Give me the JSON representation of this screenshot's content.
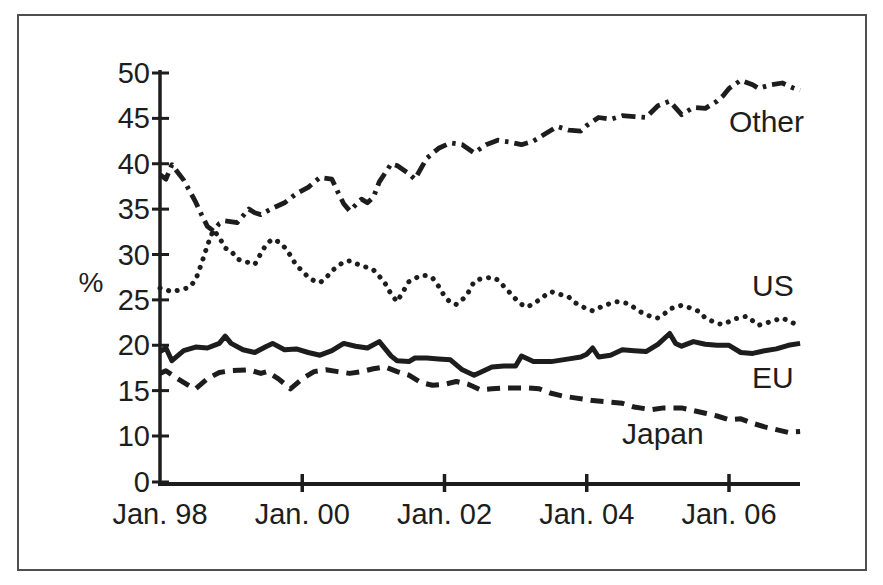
{
  "figure": {
    "background": "#ffffff",
    "border_color": "#4f4f4f",
    "ink_color": "#1d1d1d"
  },
  "chart_data": {
    "type": "line",
    "title": "",
    "ylabel": "%",
    "xlabel": "",
    "grid": false,
    "legend_position": "inline-labels",
    "x_axis": {
      "tick_labels": [
        "Jan. 98",
        "Jan. 00",
        "Jan. 02",
        "Jan. 04",
        "Jan. 06"
      ],
      "tick_months": [
        0,
        24,
        48,
        72,
        96
      ]
    },
    "y_axis": {
      "tick_labels": [
        "50",
        "45",
        "40",
        "35",
        "30",
        "25",
        "20",
        "15",
        "10",
        "0"
      ],
      "tick_values": [
        50,
        45,
        40,
        35,
        30,
        25,
        20,
        15,
        10,
        0
      ]
    },
    "series": [
      {
        "name": "Other",
        "label": "Other",
        "line_style": "dashdot",
        "label_xy": [
          729,
          132
        ],
        "points": [
          [
            0,
            38.8
          ],
          [
            1,
            38.3
          ],
          [
            2,
            39.9
          ],
          [
            4,
            38.2
          ],
          [
            6,
            35.8
          ],
          [
            7,
            34.4
          ],
          [
            8,
            33.1
          ],
          [
            9,
            32.6
          ],
          [
            10,
            33.4
          ],
          [
            11,
            33.7
          ],
          [
            13,
            33.5
          ],
          [
            15,
            35.0
          ],
          [
            16,
            34.6
          ],
          [
            17,
            34.4
          ],
          [
            19,
            35.1
          ],
          [
            21,
            35.7
          ],
          [
            23,
            36.7
          ],
          [
            25,
            37.4
          ],
          [
            27,
            38.5
          ],
          [
            29,
            38.3
          ],
          [
            30,
            36.9
          ],
          [
            31,
            35.6
          ],
          [
            32,
            34.8
          ],
          [
            34,
            36.1
          ],
          [
            35,
            35.7
          ],
          [
            36,
            36.3
          ],
          [
            37,
            38.0
          ],
          [
            39,
            40.0
          ],
          [
            40,
            39.8
          ],
          [
            42,
            38.9
          ],
          [
            43,
            38.3
          ],
          [
            45,
            40.6
          ],
          [
            47,
            41.7
          ],
          [
            49,
            42.3
          ],
          [
            51,
            42.1
          ],
          [
            53,
            41.2
          ],
          [
            55,
            42.1
          ],
          [
            57,
            42.6
          ],
          [
            59,
            42.4
          ],
          [
            61,
            42.1
          ],
          [
            63,
            42.5
          ],
          [
            65,
            43.3
          ],
          [
            67,
            44.1
          ],
          [
            69,
            43.7
          ],
          [
            71,
            43.6
          ],
          [
            72,
            44.2
          ],
          [
            74,
            45.1
          ],
          [
            76,
            44.9
          ],
          [
            78,
            45.3
          ],
          [
            80,
            45.2
          ],
          [
            82,
            45.1
          ],
          [
            84,
            46.4
          ],
          [
            86,
            46.9
          ],
          [
            88,
            45.4
          ],
          [
            90,
            46.2
          ],
          [
            92,
            46.1
          ],
          [
            94,
            46.9
          ],
          [
            95,
            47.5
          ],
          [
            96,
            48.3
          ],
          [
            98,
            49.2
          ],
          [
            100,
            48.7
          ],
          [
            101,
            48.3
          ],
          [
            103,
            48.7
          ],
          [
            105,
            48.9
          ],
          [
            107,
            48.3
          ],
          [
            108,
            48.1
          ]
        ]
      },
      {
        "name": "US",
        "label": "US",
        "line_style": "dotted",
        "label_xy": [
          752,
          296
        ],
        "points": [
          [
            0,
            26.3
          ],
          [
            2,
            25.9
          ],
          [
            4,
            26.2
          ],
          [
            5,
            26.4
          ],
          [
            6,
            27.2
          ],
          [
            7,
            29.0
          ],
          [
            8,
            31.0
          ],
          [
            9,
            32.7
          ],
          [
            10,
            31.9
          ],
          [
            11,
            30.7
          ],
          [
            12,
            30.4
          ],
          [
            13,
            29.5
          ],
          [
            14,
            29.3
          ],
          [
            15,
            29.1
          ],
          [
            16,
            28.9
          ],
          [
            17,
            30.1
          ],
          [
            18,
            31.2
          ],
          [
            19,
            31.7
          ],
          [
            20,
            31.4
          ],
          [
            21,
            30.8
          ],
          [
            22,
            29.9
          ],
          [
            23,
            28.8
          ],
          [
            24,
            28.2
          ],
          [
            25,
            27.5
          ],
          [
            26,
            27.1
          ],
          [
            27,
            26.9
          ],
          [
            28,
            27.4
          ],
          [
            29,
            28.2
          ],
          [
            30,
            28.7
          ],
          [
            31,
            29.2
          ],
          [
            32,
            29.3
          ],
          [
            33,
            29.0
          ],
          [
            34,
            28.8
          ],
          [
            36,
            28.3
          ],
          [
            37,
            27.6
          ],
          [
            38,
            26.8
          ],
          [
            39,
            25.6
          ],
          [
            40,
            24.8
          ],
          [
            41,
            25.9
          ],
          [
            42,
            27.0
          ],
          [
            44,
            27.7
          ],
          [
            45,
            27.7
          ],
          [
            46,
            27.4
          ],
          [
            47,
            26.5
          ],
          [
            48,
            25.4
          ],
          [
            49,
            24.7
          ],
          [
            50,
            24.5
          ],
          [
            51,
            25.0
          ],
          [
            52,
            25.8
          ],
          [
            53,
            27.0
          ],
          [
            54,
            27.3
          ],
          [
            56,
            27.5
          ],
          [
            57,
            27.2
          ],
          [
            58,
            26.5
          ],
          [
            59,
            25.8
          ],
          [
            60,
            25.1
          ],
          [
            61,
            24.5
          ],
          [
            62,
            24.2
          ],
          [
            63,
            24.6
          ],
          [
            64,
            25.0
          ],
          [
            65,
            25.5
          ],
          [
            66,
            25.9
          ],
          [
            67,
            25.7
          ],
          [
            68,
            25.5
          ],
          [
            69,
            25.3
          ],
          [
            70,
            24.7
          ],
          [
            72,
            24.0
          ],
          [
            73,
            23.8
          ],
          [
            75,
            24.4
          ],
          [
            77,
            24.8
          ],
          [
            79,
            24.6
          ],
          [
            81,
            23.7
          ],
          [
            83,
            23.1
          ],
          [
            84,
            23.0
          ],
          [
            85,
            23.4
          ],
          [
            86,
            24.0
          ],
          [
            88,
            24.4
          ],
          [
            90,
            24.0
          ],
          [
            91,
            23.7
          ],
          [
            92,
            23.0
          ],
          [
            94,
            22.4
          ],
          [
            95,
            22.3
          ],
          [
            97,
            22.9
          ],
          [
            99,
            23.2
          ],
          [
            101,
            22.2
          ],
          [
            103,
            22.6
          ],
          [
            105,
            23.0
          ],
          [
            107,
            22.4
          ],
          [
            108,
            21.9
          ]
        ]
      },
      {
        "name": "EU",
        "label": "EU",
        "line_style": "solid",
        "label_xy": [
          752,
          388
        ],
        "points": [
          [
            0,
            19.3
          ],
          [
            1,
            19.7
          ],
          [
            2,
            18.3
          ],
          [
            4,
            19.4
          ],
          [
            6,
            19.8
          ],
          [
            8,
            19.7
          ],
          [
            10,
            20.2
          ],
          [
            11,
            21.0
          ],
          [
            12,
            20.2
          ],
          [
            14,
            19.5
          ],
          [
            16,
            19.2
          ],
          [
            18,
            19.9
          ],
          [
            19,
            20.2
          ],
          [
            21,
            19.5
          ],
          [
            23,
            19.6
          ],
          [
            25,
            19.2
          ],
          [
            27,
            18.9
          ],
          [
            29,
            19.4
          ],
          [
            31,
            20.2
          ],
          [
            33,
            19.9
          ],
          [
            35,
            19.7
          ],
          [
            37,
            20.4
          ],
          [
            39,
            18.8
          ],
          [
            40,
            18.3
          ],
          [
            42,
            18.2
          ],
          [
            43,
            18.6
          ],
          [
            45,
            18.6
          ],
          [
            47,
            18.5
          ],
          [
            49,
            18.4
          ],
          [
            51,
            17.3
          ],
          [
            53,
            16.7
          ],
          [
            54,
            17.0
          ],
          [
            56,
            17.6
          ],
          [
            58,
            17.7
          ],
          [
            60,
            17.7
          ],
          [
            61,
            18.8
          ],
          [
            63,
            18.2
          ],
          [
            66,
            18.2
          ],
          [
            69,
            18.5
          ],
          [
            71,
            18.7
          ],
          [
            72,
            19.0
          ],
          [
            73,
            19.7
          ],
          [
            74,
            18.7
          ],
          [
            76,
            18.9
          ],
          [
            78,
            19.5
          ],
          [
            80,
            19.4
          ],
          [
            82,
            19.3
          ],
          [
            84,
            20.1
          ],
          [
            86,
            21.3
          ],
          [
            87,
            20.2
          ],
          [
            88,
            19.9
          ],
          [
            90,
            20.4
          ],
          [
            92,
            20.1
          ],
          [
            94,
            20.0
          ],
          [
            96,
            20.0
          ],
          [
            98,
            19.2
          ],
          [
            100,
            19.1
          ],
          [
            102,
            19.4
          ],
          [
            104,
            19.6
          ],
          [
            106,
            20.0
          ],
          [
            108,
            20.2
          ]
        ]
      },
      {
        "name": "Japan",
        "label": "Japan",
        "line_style": "dashed",
        "label_xy": [
          622,
          444
        ],
        "points": [
          [
            0,
            16.9
          ],
          [
            1,
            17.2
          ],
          [
            3,
            16.3
          ],
          [
            5,
            15.5
          ],
          [
            6,
            15.2
          ],
          [
            8,
            16.3
          ],
          [
            10,
            17.0
          ],
          [
            12,
            17.2
          ],
          [
            15,
            17.3
          ],
          [
            17,
            16.9
          ],
          [
            18,
            17.1
          ],
          [
            20,
            16.3
          ],
          [
            22,
            15.2
          ],
          [
            24,
            16.3
          ],
          [
            26,
            17.1
          ],
          [
            28,
            17.3
          ],
          [
            30,
            17.1
          ],
          [
            32,
            16.9
          ],
          [
            34,
            17.1
          ],
          [
            36,
            17.4
          ],
          [
            38,
            17.6
          ],
          [
            40,
            17.1
          ],
          [
            42,
            16.7
          ],
          [
            44,
            15.9
          ],
          [
            46,
            15.6
          ],
          [
            48,
            15.7
          ],
          [
            50,
            16.0
          ],
          [
            52,
            15.7
          ],
          [
            54,
            15.1
          ],
          [
            56,
            15.2
          ],
          [
            58,
            15.3
          ],
          [
            60,
            15.3
          ],
          [
            62,
            15.3
          ],
          [
            64,
            15.2
          ],
          [
            66,
            14.7
          ],
          [
            68,
            14.4
          ],
          [
            70,
            14.2
          ],
          [
            73,
            13.9
          ],
          [
            75,
            13.8
          ],
          [
            78,
            13.6
          ],
          [
            80,
            13.2
          ],
          [
            83,
            12.9
          ],
          [
            85,
            13.1
          ],
          [
            88,
            13.1
          ],
          [
            90,
            12.8
          ],
          [
            92,
            12.5
          ],
          [
            94,
            12.2
          ],
          [
            96,
            11.8
          ],
          [
            98,
            11.9
          ],
          [
            100,
            11.4
          ],
          [
            102,
            11.0
          ],
          [
            104,
            10.7
          ],
          [
            106,
            10.4
          ],
          [
            108,
            10.5
          ]
        ]
      }
    ]
  }
}
